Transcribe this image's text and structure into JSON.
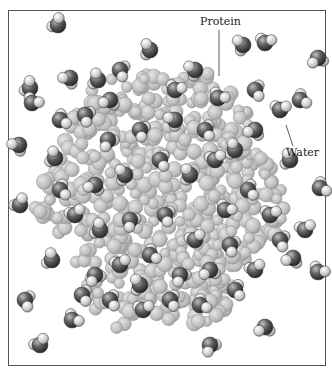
{
  "figure": {
    "labels": {
      "protein": "Protein",
      "water": "Water"
    },
    "colors": {
      "background": "#ffffff",
      "frame": "#555555",
      "protein_atom_fill": "#c8c8c8",
      "protein_atom_edge": "#9a9a9a",
      "water_oxygen": "#5a5a5a",
      "water_hydrogen": "#d8d8d8",
      "leader_line": "#333333"
    }
  }
}
